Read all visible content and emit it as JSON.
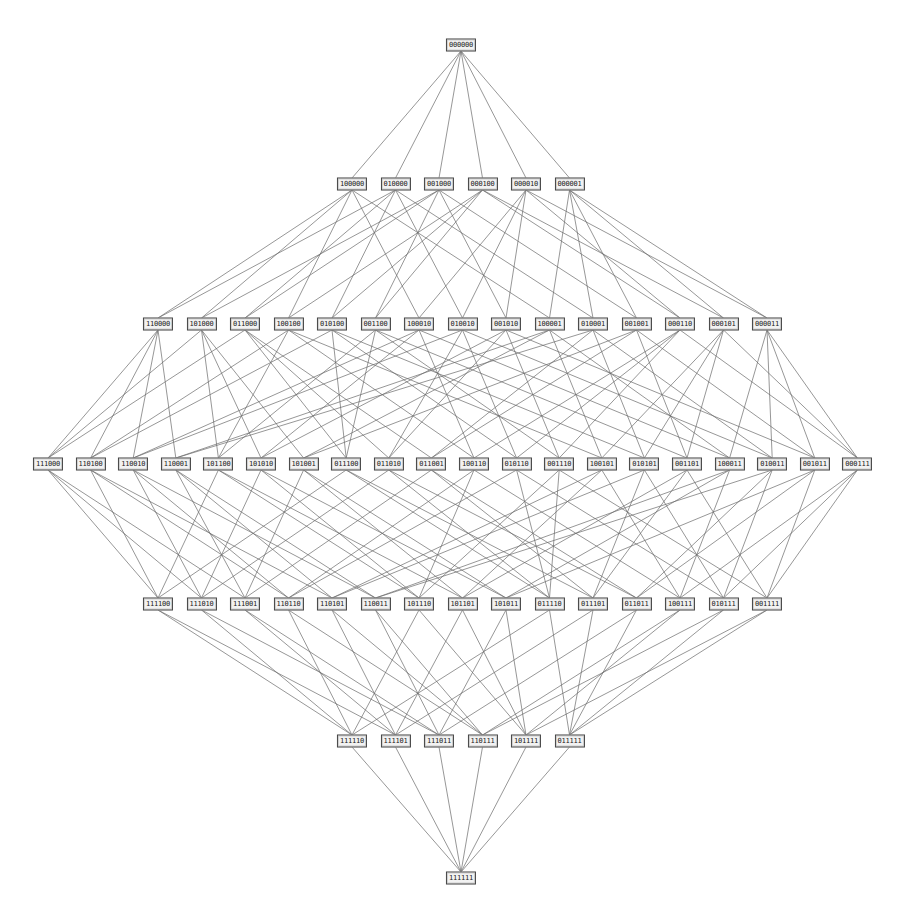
{
  "diagram": {
    "type": "hasse-diagram",
    "edge_color": "#6a6a6a",
    "node_border_color": "#444444",
    "node_fill_color": "#f2f2f2",
    "levels": [
      {
        "rank": 0,
        "y": 45,
        "x_start": 461,
        "x_step": 0,
        "nodes": [
          "000000"
        ]
      },
      {
        "rank": 1,
        "y": 184,
        "x_start": 352,
        "x_step": 43.5,
        "nodes": [
          "100000",
          "010000",
          "001000",
          "000100",
          "000010",
          "000001"
        ]
      },
      {
        "rank": 2,
        "y": 324,
        "x_start": 158,
        "x_step": 43.5,
        "nodes": [
          "110000",
          "101000",
          "011000",
          "100100",
          "010100",
          "001100",
          "100010",
          "010010",
          "001010",
          "100001",
          "010001",
          "001001",
          "000110",
          "000101",
          "000011"
        ]
      },
      {
        "rank": 3,
        "y": 464,
        "x_start": 48,
        "x_step": 42.6,
        "nodes": [
          "111000",
          "110100",
          "110010",
          "110001",
          "101100",
          "101010",
          "101001",
          "011100",
          "011010",
          "011001",
          "100110",
          "010110",
          "001110",
          "100101",
          "010101",
          "001101",
          "100011",
          "010011",
          "001011",
          "000111"
        ]
      },
      {
        "rank": 4,
        "y": 604,
        "x_start": 158,
        "x_step": 43.5,
        "nodes": [
          "111100",
          "111010",
          "111001",
          "110110",
          "110101",
          "110011",
          "101110",
          "101101",
          "101011",
          "011110",
          "011101",
          "011011",
          "100111",
          "010111",
          "001111"
        ]
      },
      {
        "rank": 5,
        "y": 741,
        "x_start": 352,
        "x_step": 43.5,
        "nodes": [
          "111110",
          "111101",
          "111011",
          "110111",
          "101111",
          "011111"
        ]
      },
      {
        "rank": 6,
        "y": 878,
        "x_start": 461,
        "x_step": 0,
        "nodes": [
          "111111"
        ]
      }
    ]
  }
}
